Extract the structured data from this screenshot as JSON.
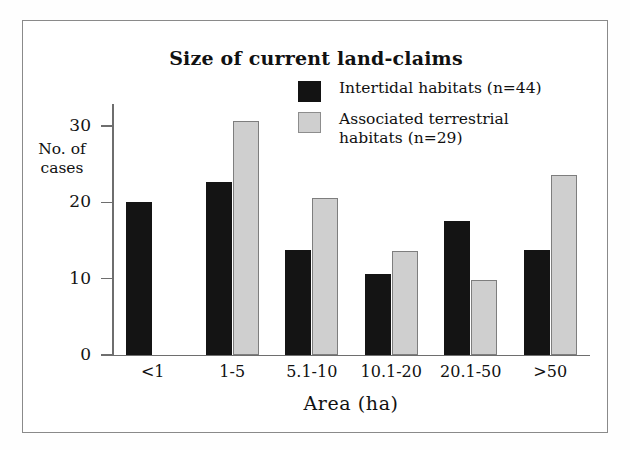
{
  "figure": {
    "border_color": "#8a8a8a",
    "background": "#ffffff"
  },
  "legend": {
    "position": "top-right",
    "entries": [
      {
        "label": "Intertidal habitats (n=44)",
        "color": "#141414",
        "swatch": "black-swatch"
      },
      {
        "label": "Associated terrestrial\nhabitats (n=29)",
        "color": "#cfcfcf",
        "swatch": "gray-swatch"
      }
    ]
  },
  "chart_data": {
    "type": "bar",
    "title": "Size of current land-claims",
    "xlabel": "Area (ha)",
    "ylabel": "No. of\ncases",
    "categories": [
      "<1",
      "1-5",
      "5.1-10",
      "10.1-20",
      "20.1-50",
      ">50"
    ],
    "series": [
      {
        "name": "Intertidal habitats (n=44)",
        "color": "#141414",
        "values": [
          20.0,
          22.7,
          13.7,
          10.6,
          17.6,
          13.7
        ]
      },
      {
        "name": "Associated terrestrial habitats (n=29)",
        "color": "#cfcfcf",
        "values": [
          0,
          30.7,
          20.6,
          13.6,
          9.8,
          23.6
        ]
      }
    ],
    "ylim": [
      0,
      32
    ],
    "yticks": [
      0,
      10,
      20,
      30
    ],
    "ytick_labels": [
      "0",
      "10",
      "20",
      "30"
    ],
    "grid": false,
    "legend_position": "upper right"
  }
}
